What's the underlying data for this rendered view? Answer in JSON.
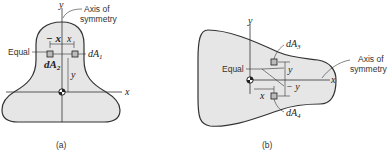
{
  "figure_a": {
    "caption": "(a)",
    "axis_y": "y",
    "axis_x": "x",
    "axis_of_symmetry": [
      "Axis of",
      "symmetry"
    ],
    "equal_label": "Equal",
    "neg_x": "− x",
    "pos_x": "x",
    "y_label": "y",
    "dA1": "dA",
    "dA1_sub": "1",
    "dA2": "dA",
    "dA2_sub": "2"
  },
  "figure_b": {
    "caption": "(b)",
    "axis_y": "y",
    "axis_x": "x",
    "axis_of_symmetry": [
      "Axis of",
      "symmetry"
    ],
    "equal_label": "Equal",
    "pos_y": "y",
    "neg_y": "− y",
    "x_label": "x",
    "dA3": "dA",
    "dA3_sub": "3",
    "dA4": "dA",
    "dA4_sub": "4"
  },
  "colors": {
    "fill": "#e6e6e6",
    "stroke": "#333333"
  }
}
